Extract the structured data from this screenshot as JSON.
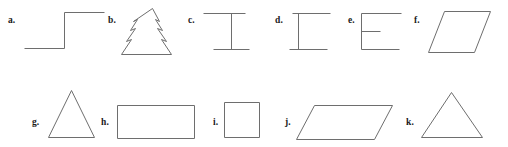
{
  "sheet": {
    "width": 508,
    "height": 147,
    "background_color": "#ffffff",
    "stroke_color": "#6e6e6e",
    "label_color": "#1a1a1a"
  },
  "figures": [
    {
      "key": "a",
      "label": "a.",
      "shape_name": "step-line",
      "description": "open polyline forming an ascending step",
      "row": 1,
      "label_x": 8,
      "label_y": 16,
      "box_x": 24,
      "box_y": 10,
      "box_w": 80,
      "box_h": 40,
      "points": "0,38 40,38 40,2 80,2"
    },
    {
      "key": "b",
      "label": "b.",
      "shape_name": "fir-tree",
      "description": "closed outline of a christmas tree with three tiers",
      "row": 1,
      "label_x": 108,
      "label_y": 16,
      "box_x": 121,
      "box_y": 8,
      "box_w": 62,
      "box_h": 48,
      "points": "31,0 38,13 34,11 41,22 36,20 45,33 40,31 50,46 0,46 10,31 5,33 14,20 9,22 16,11 12,13"
    },
    {
      "key": "c",
      "label": "c.",
      "shape_name": "i-beam-right",
      "description": "vertical stem toward the right with top and bottom horizontal caps",
      "row": 1,
      "label_x": 188,
      "label_y": 16,
      "box_x": 203,
      "box_y": 12,
      "box_w": 42,
      "box_h": 38,
      "stem_x": 28,
      "points": "0,1 42,1 M 28,1 L 28,37 M 10,37 L 46,37"
    },
    {
      "key": "d",
      "label": "d.",
      "shape_name": "i-beam-left",
      "description": "vertical stem toward the left with top and bottom horizontal caps",
      "row": 1,
      "label_x": 275,
      "label_y": 16,
      "box_x": 289,
      "box_y": 12,
      "box_w": 42,
      "box_h": 38,
      "stem_x": 9,
      "points": "3,1 41,1 M 9,1 L 9,37 M 0,37 L 38,37"
    },
    {
      "key": "e",
      "label": "e.",
      "shape_name": "f-shape",
      "description": "vertical stem on the left with a long top arm and a short middle arm",
      "row": 1,
      "label_x": 348,
      "label_y": 16,
      "box_x": 361,
      "box_y": 12,
      "box_w": 40,
      "box_h": 38,
      "points": "0,1 40,1 M 0,1 L 0,37 M 0,19 L 19,19 M 0,37 L 38,37"
    },
    {
      "key": "f",
      "label": "f.",
      "shape_name": "parallelogram-tall",
      "description": "closed parallelogram leaning to the right",
      "row": 1,
      "label_x": 414,
      "label_y": 16,
      "box_x": 428,
      "box_y": 11,
      "box_w": 62,
      "box_h": 41,
      "points": "16,0 62,0 46,41 0,41"
    },
    {
      "key": "g",
      "label": "g.",
      "shape_name": "triangle-narrow",
      "description": "closed isosceles triangle, relatively tall and narrow",
      "row": 2,
      "label_x": 32,
      "label_y": 118,
      "box_x": 48,
      "box_y": 90,
      "box_w": 46,
      "box_h": 47,
      "points": "23,0 46,47 0,47"
    },
    {
      "key": "h",
      "label": "h.",
      "shape_name": "rectangle-wide",
      "description": "closed wide rectangle",
      "row": 2,
      "label_x": 101,
      "label_y": 118,
      "box_x": 117,
      "box_y": 105,
      "box_w": 77,
      "box_h": 33,
      "points": "0,0 77,0 77,33 0,33"
    },
    {
      "key": "i",
      "label": "i.",
      "shape_name": "square",
      "description": "closed square",
      "row": 2,
      "label_x": 213,
      "label_y": 118,
      "box_x": 224,
      "box_y": 102,
      "box_w": 35,
      "box_h": 35,
      "points": "0,0 35,0 35,35 0,35"
    },
    {
      "key": "j",
      "label": "j.",
      "shape_name": "parallelogram-wide",
      "description": "closed wide parallelogram leaning to the right",
      "row": 2,
      "label_x": 285,
      "label_y": 118,
      "box_x": 296,
      "box_y": 105,
      "box_w": 96,
      "box_h": 34,
      "points": "18,0 96,0 78,34 0,34"
    },
    {
      "key": "k",
      "label": "k.",
      "shape_name": "triangle-wide",
      "description": "closed isosceles triangle, wider than figure g",
      "row": 2,
      "label_x": 406,
      "label_y": 118,
      "box_x": 421,
      "box_y": 92,
      "box_w": 61,
      "box_h": 45,
      "points": "30,0 61,45 0,45"
    }
  ]
}
